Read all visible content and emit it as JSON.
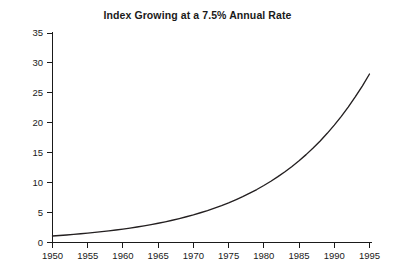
{
  "chart_data": {
    "type": "line",
    "title": "Index Growing at a 7.5% Annual Rate",
    "xlabel": "",
    "ylabel": "",
    "xlim": [
      1950,
      1995
    ],
    "ylim": [
      0,
      35
    ],
    "grid": false,
    "legend": null,
    "xticks": [
      1950,
      1955,
      1960,
      1965,
      1970,
      1975,
      1980,
      1985,
      1990,
      1995
    ],
    "xtick_labels": [
      "1950",
      "1955",
      "1960",
      "1965",
      "1970",
      "1975",
      "1980",
      "1985",
      "1990",
      "1995"
    ],
    "yticks": [
      0,
      5,
      10,
      15,
      20,
      25,
      30,
      35
    ],
    "ytick_labels": [
      "0",
      "5",
      "10",
      "15",
      "20",
      "25",
      "30",
      "35"
    ],
    "annual_rate_percent": 7.5,
    "series": [
      {
        "name": "Index",
        "color": "#231f20",
        "x": [
          1950,
          1951,
          1952,
          1953,
          1954,
          1955,
          1956,
          1957,
          1958,
          1959,
          1960,
          1961,
          1962,
          1963,
          1964,
          1965,
          1966,
          1967,
          1968,
          1969,
          1970,
          1971,
          1972,
          1973,
          1974,
          1975,
          1976,
          1977,
          1978,
          1979,
          1980,
          1981,
          1982,
          1983,
          1984,
          1985,
          1986,
          1987,
          1988,
          1989,
          1990,
          1991,
          1992,
          1993,
          1994,
          1995
        ],
        "values": [
          1.09,
          1.17,
          1.26,
          1.35,
          1.46,
          1.56,
          1.68,
          1.81,
          1.94,
          2.09,
          2.24,
          2.41,
          2.59,
          2.79,
          3.0,
          3.22,
          3.46,
          3.72,
          4.0,
          4.3,
          4.62,
          4.97,
          5.34,
          5.74,
          6.17,
          6.63,
          7.13,
          7.66,
          8.24,
          8.85,
          9.52,
          10.23,
          11.0,
          11.82,
          12.71,
          13.66,
          14.68,
          15.78,
          16.97,
          18.24,
          19.61,
          21.08,
          22.66,
          24.36,
          26.18,
          28.15
        ]
      }
    ]
  }
}
